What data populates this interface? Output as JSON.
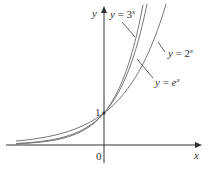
{
  "chart_data": {
    "type": "line",
    "title": "",
    "xlabel": "x",
    "ylabel": "y",
    "xlim": [
      -3.0,
      3.6
    ],
    "ylim": [
      -0.8,
      4.4
    ],
    "grid": false,
    "legend_position": "inline annotations",
    "series": [
      {
        "name": "y = 3^x",
        "label_base": "y = 3",
        "label_exp": "x",
        "base": 3
      },
      {
        "name": "y = 2^x",
        "label_base": "y = 2",
        "label_exp": "x",
        "base": 2
      },
      {
        "name": "y = e^x",
        "label_base": "y = e",
        "label_exp": "x",
        "base": 2.718281828
      }
    ],
    "annotations": [
      {
        "text": "1",
        "at": [
          0,
          1
        ]
      },
      {
        "text": "0",
        "at": [
          0,
          0
        ]
      }
    ],
    "colors": {
      "curve": "#777777",
      "axis": "#333333",
      "text": "#333333"
    }
  },
  "axes": {
    "x_label": "x",
    "y_label": "y",
    "origin_label": "0",
    "one_label": "1"
  }
}
